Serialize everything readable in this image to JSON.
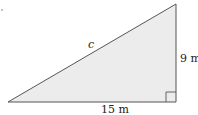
{
  "diagram": {
    "type": "right-triangle",
    "labels": {
      "hypotenuse": "c",
      "vertical_side": "9 m",
      "horizontal_side": "15 m"
    },
    "colors": {
      "fill": "#ececec",
      "stroke": "#555555"
    }
  }
}
